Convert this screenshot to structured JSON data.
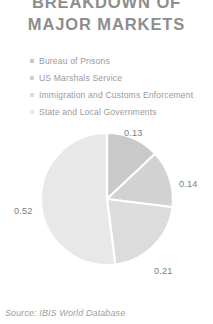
{
  "title": {
    "line1": "BREAKDOWN OF",
    "line2": "MAJOR MARKETS"
  },
  "legend": {
    "items": [
      {
        "label": "Bureau of Prisons",
        "marker": "square-marker",
        "color": "#c9c9c9"
      },
      {
        "label": "US Marshals Service",
        "marker": "square-marker",
        "color": "#d2d2d2"
      },
      {
        "label": "Immigration and Customs Enforcement",
        "marker": "square-marker",
        "color": "#dcdcdc"
      },
      {
        "label": "State and Local Governments",
        "marker": "square-marker",
        "color": "#e8e8e8"
      }
    ]
  },
  "source": {
    "text": "Source: IBIS World Database"
  },
  "chart_data": {
    "type": "pie",
    "title": "BREAKDOWN OF MAJOR MARKETS",
    "subtitle": "",
    "xlabel": "",
    "ylabel": "",
    "categories": [
      "Bureau of Prisons",
      "US Marshals Service",
      "Immigration and Customs Enforcement",
      "State and Local Governments"
    ],
    "values": [
      0.13,
      0.14,
      0.21,
      0.52
    ],
    "value_labels": [
      "0.13",
      "0.14",
      "0.21",
      "0.52"
    ],
    "colors": [
      "#c9c9c9",
      "#d2d2d2",
      "#dcdcdc",
      "#e8e8e8"
    ],
    "slice_border_color": "#ffffff",
    "legend_position": "top",
    "grid": false,
    "start_angle_deg": 0,
    "direction": "clockwise"
  }
}
